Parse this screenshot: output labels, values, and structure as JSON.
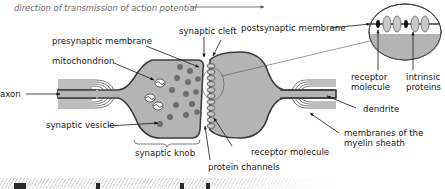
{
  "diagram": {
    "title_arrow_label": "direction of transmission of action potential",
    "labels": {
      "synaptic_cleft": "synaptic cleft",
      "presynaptic_membrane": "presynaptic membrane",
      "postsynaptic_membrane": "postsynaptic membrane",
      "mitochondrion": "mitochondrion",
      "axon": "axon",
      "synaptic_vesicle": "synaptic vesicle",
      "synaptic_knob": "synaptic knob",
      "protein_channels": "protein channels",
      "receptor_molecule_bottom": "receptor molecule",
      "dendrite": "dendrite",
      "myelin_line1": "membranes of the",
      "myelin_line2": "myelin sheath",
      "inset_receptor_line1": "receptor",
      "inset_receptor_line2": "molecule",
      "inset_intrinsic_line1": "intrinsic",
      "inset_intrinsic_line2": "proteins"
    },
    "colors": {
      "cell_fill": "#b4b4b4",
      "membrane": "#3c3c3c",
      "vesicle": "#6e6e6e",
      "channel_fill": "#c8c8c8",
      "receptor": "#111111",
      "text": "#1a1a1a",
      "italic_text": "#6a6a6a"
    }
  }
}
